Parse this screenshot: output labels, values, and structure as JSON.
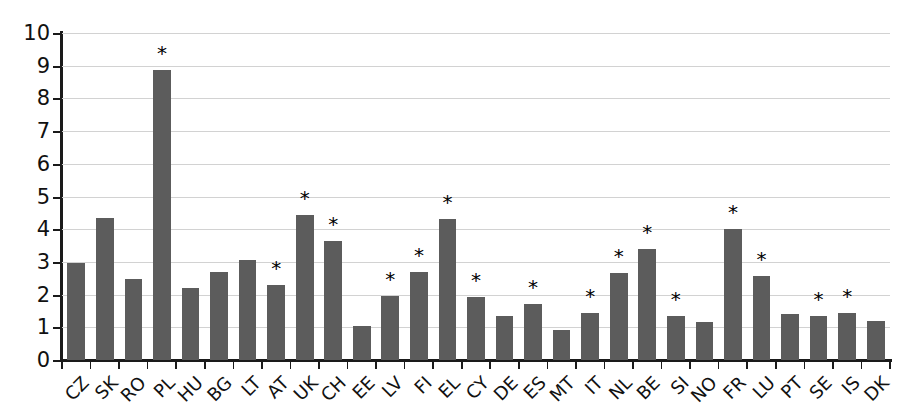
{
  "chart_data": {
    "type": "bar",
    "title": "",
    "subtitle": "",
    "xlabel": "",
    "ylabel": "",
    "ylim": [
      0,
      10
    ],
    "ytick_labels": [
      "10",
      "9",
      "8",
      "7",
      "6",
      "5",
      "4",
      "3",
      "2",
      "1",
      "0"
    ],
    "yticks": [
      10,
      9,
      8,
      7,
      6,
      5,
      4,
      3,
      2,
      1,
      0
    ],
    "grid": true,
    "grid_axis": "y",
    "legend": "none",
    "bar_color": "#5c5c5c",
    "annotation_symbol": "*",
    "annotation_meaning": "significant",
    "categories": [
      "CZ",
      "SK",
      "RO",
      "PL",
      "HU",
      "BG",
      "LT",
      "AT",
      "UK",
      "CH",
      "EE",
      "LV",
      "FI",
      "EL",
      "CY",
      "DE",
      "ES",
      "MT",
      "IT",
      "NL",
      "BE",
      "SI",
      "NO",
      "FR",
      "LU",
      "PT",
      "SE",
      "IS",
      "DK"
    ],
    "values": [
      2.98,
      4.35,
      2.48,
      8.87,
      2.2,
      2.7,
      3.05,
      2.3,
      4.45,
      3.65,
      1.05,
      1.97,
      2.7,
      4.3,
      1.92,
      1.34,
      1.72,
      0.93,
      1.45,
      2.65,
      3.38,
      1.35,
      1.17,
      4.0,
      2.57,
      1.42,
      1.35,
      1.45,
      1.2
    ],
    "annotated": [
      false,
      false,
      false,
      true,
      false,
      false,
      false,
      true,
      true,
      true,
      false,
      true,
      true,
      true,
      true,
      false,
      true,
      false,
      true,
      true,
      true,
      true,
      false,
      true,
      true,
      false,
      true,
      true,
      false
    ]
  }
}
